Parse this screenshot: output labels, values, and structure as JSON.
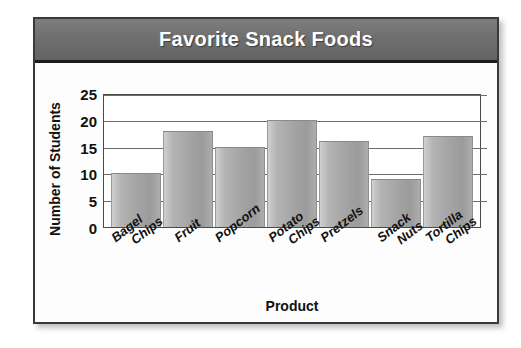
{
  "card": {
    "title": "Favorite Snack Foods"
  },
  "chart_data": {
    "type": "bar",
    "title": "Favorite Snack Foods",
    "xlabel": "Product",
    "ylabel": "Number of Students",
    "categories": [
      "Bagel Chips",
      "Fruit",
      "Popcorn",
      "Potato Chips",
      "Pretzels",
      "Snack Nuts",
      "Tortilla Chips"
    ],
    "category_lines": [
      [
        "Bagel",
        "Chips"
      ],
      [
        "Fruit",
        ""
      ],
      [
        "Popcorn",
        ""
      ],
      [
        "Potato",
        "Chips"
      ],
      [
        "Pretzels",
        ""
      ],
      [
        "Snack",
        "Nuts"
      ],
      [
        "Tortilla",
        "Chips"
      ]
    ],
    "values": [
      10,
      18,
      15,
      20,
      16,
      9,
      17
    ],
    "ylim": [
      0,
      25
    ],
    "yticks": [
      0,
      5,
      10,
      15,
      20,
      25
    ],
    "ytick_labels": [
      "0",
      "5",
      "10",
      "15",
      "20",
      "25"
    ],
    "grid": true,
    "grid_axis": "y",
    "legend": "none",
    "bar_color": "#a8a8a8",
    "title_band_color": "#6f6f6f",
    "title_text_color": "#ffffff",
    "axis_color": "#4a4a4a"
  }
}
